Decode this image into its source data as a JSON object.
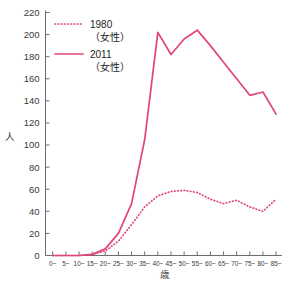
{
  "chart_data": {
    "type": "line",
    "title": "",
    "xlabel": "歳",
    "ylabel": "人",
    "ylim": [
      0,
      220
    ],
    "ytick_step": 20,
    "grid": false,
    "legend_position": "top-left",
    "categories": [
      "0~",
      "5~",
      "10~",
      "15~",
      "20~",
      "25~",
      "30~",
      "35~",
      "40~",
      "45~",
      "50~",
      "55~",
      "60~",
      "65~",
      "70~",
      "75~",
      "80~",
      "85~"
    ],
    "yticks": [
      "0",
      "20",
      "40",
      "60",
      "80",
      "100",
      "120",
      "140",
      "160",
      "180",
      "200",
      "220"
    ],
    "series": [
      {
        "name": "1980（女性）",
        "label_line1": "1980",
        "label_line2": "（女性）",
        "style": "dotted",
        "color": "#e0457b",
        "values": [
          0,
          0,
          0,
          1,
          4,
          13,
          28,
          44,
          54,
          58,
          59,
          57,
          51,
          47,
          50,
          44,
          40,
          51
        ]
      },
      {
        "name": "2011（女性）",
        "label_line1": "2011",
        "label_line2": "（女性）",
        "style": "solid",
        "color": "#e0457b",
        "values": [
          0,
          0,
          0,
          1,
          6,
          20,
          47,
          105,
          202,
          182,
          196,
          204,
          190,
          175,
          160,
          145,
          148,
          128
        ]
      }
    ]
  },
  "legend": {
    "items": [
      {
        "line1": "1980",
        "line2": "（女性）",
        "style": "dotted"
      },
      {
        "line1": "2011",
        "line2": "（女性）",
        "style": "solid"
      }
    ]
  },
  "axes": {
    "y_title": "人",
    "x_title": "歳"
  },
  "colors": {
    "series": "#e0457b",
    "axis": "#6e6e6e",
    "text": "#3a3a3a"
  }
}
